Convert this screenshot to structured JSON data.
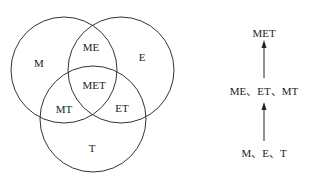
{
  "venn": {
    "circles": [
      {
        "id": "M",
        "cx": 64,
        "cy": 70,
        "r": 53
      },
      {
        "id": "E",
        "cx": 121,
        "cy": 70,
        "r": 53
      },
      {
        "id": "T",
        "cx": 93,
        "cy": 119,
        "r": 53
      }
    ],
    "regions": {
      "M": "M",
      "E": "E",
      "T": "T",
      "ME": "ME",
      "MT": "MT",
      "ET": "ET",
      "MET": "MET"
    }
  },
  "hierarchy": {
    "top": "MET",
    "middle": "ME、ET、MT",
    "bottom": "M、E、T"
  },
  "colors": {
    "stroke": "#333333",
    "text": "#222222"
  }
}
